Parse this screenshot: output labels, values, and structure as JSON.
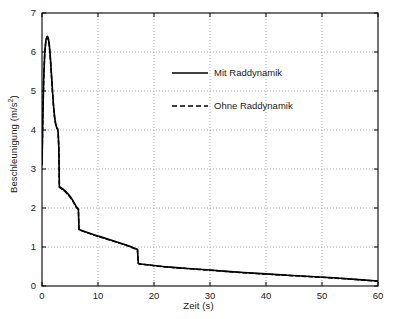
{
  "chart_data": {
    "type": "line",
    "title": "",
    "xlabel": "Zeit (s)",
    "ylabel": "Beschleunigung (m/s²)",
    "xlim": [
      0,
      60
    ],
    "ylim": [
      0,
      7
    ],
    "xticks": [
      0,
      10,
      20,
      30,
      40,
      50,
      60
    ],
    "yticks": [
      0,
      1,
      2,
      3,
      4,
      5,
      6,
      7
    ],
    "xtick_labels": [
      "0",
      "10",
      "20",
      "30",
      "40",
      "50",
      "60"
    ],
    "ytick_labels": [
      "0",
      "1",
      "2",
      "3",
      "4",
      "5",
      "6",
      "7"
    ],
    "grid": true,
    "grid_style": "dotted",
    "legend_position": "upper center",
    "line_color": "#000000",
    "series": [
      {
        "name": "Mit Raddynamik",
        "style": "solid",
        "x": [
          0.0,
          0.15,
          0.3,
          0.5,
          0.7,
          0.85,
          1.0,
          1.15,
          1.3,
          1.5,
          1.7,
          1.9,
          2.1,
          2.3,
          2.5,
          2.65,
          2.8,
          2.9,
          3.0,
          3.05,
          3.1,
          3.4,
          3.8,
          4.2,
          4.6,
          5.0,
          5.4,
          5.8,
          6.1,
          6.35,
          6.5,
          6.55,
          6.6,
          7.0,
          7.6,
          8.4,
          9.4,
          10.5,
          11.6,
          12.7,
          13.8,
          14.9,
          15.8,
          16.5,
          16.9,
          17.05,
          17.1,
          17.2,
          17.6,
          18.5,
          20.0,
          22.0,
          24.0,
          26.0,
          28.0,
          30.0,
          33.0,
          36.0,
          40.0,
          44.0,
          48.0,
          52.0,
          56.0,
          60.0
        ],
        "y": [
          3.1,
          4.3,
          5.3,
          6.0,
          6.3,
          6.38,
          6.4,
          6.34,
          6.2,
          5.85,
          5.4,
          4.95,
          4.55,
          4.28,
          4.12,
          4.06,
          4.03,
          3.9,
          3.55,
          3.1,
          2.55,
          2.52,
          2.48,
          2.43,
          2.37,
          2.3,
          2.22,
          2.12,
          2.04,
          2.0,
          1.98,
          1.72,
          1.45,
          1.43,
          1.4,
          1.36,
          1.31,
          1.26,
          1.21,
          1.16,
          1.11,
          1.06,
          1.01,
          0.97,
          0.95,
          0.94,
          0.8,
          0.58,
          0.565,
          0.55,
          0.525,
          0.495,
          0.47,
          0.45,
          0.43,
          0.41,
          0.375,
          0.345,
          0.31,
          0.275,
          0.245,
          0.21,
          0.17,
          0.13
        ]
      },
      {
        "name": "Ohne Raddynamik",
        "style": "dashed",
        "x": [
          0.0,
          0.15,
          0.3,
          0.5,
          0.7,
          0.85,
          1.0,
          1.15,
          1.3,
          1.5,
          1.7,
          1.9,
          2.1,
          2.3,
          2.5,
          2.65,
          2.8,
          2.9,
          3.0,
          3.05,
          3.1,
          3.4,
          3.8,
          4.2,
          4.6,
          5.0,
          5.4,
          5.8,
          6.1,
          6.35,
          6.5,
          6.55,
          6.6,
          7.0,
          7.6,
          8.4,
          9.4,
          10.5,
          11.6,
          12.7,
          13.8,
          14.9,
          15.8,
          16.5,
          16.9,
          17.05,
          17.1,
          17.2,
          17.6,
          18.5,
          20.0,
          22.0,
          24.0,
          26.0,
          28.0,
          30.0,
          33.0,
          36.0,
          40.0,
          44.0,
          48.0,
          52.0,
          56.0,
          60.0
        ],
        "y": [
          3.12,
          4.32,
          5.32,
          6.02,
          6.3,
          6.36,
          6.36,
          6.3,
          6.16,
          5.81,
          5.36,
          4.92,
          4.52,
          4.26,
          4.1,
          4.04,
          4.01,
          3.88,
          3.53,
          3.08,
          2.53,
          2.5,
          2.46,
          2.41,
          2.35,
          2.28,
          2.2,
          2.1,
          2.02,
          1.98,
          1.96,
          1.7,
          1.44,
          1.42,
          1.39,
          1.35,
          1.3,
          1.25,
          1.2,
          1.15,
          1.1,
          1.05,
          1.0,
          0.96,
          0.94,
          0.93,
          0.79,
          0.575,
          0.56,
          0.545,
          0.52,
          0.49,
          0.465,
          0.445,
          0.425,
          0.405,
          0.37,
          0.34,
          0.305,
          0.27,
          0.24,
          0.205,
          0.165,
          0.125
        ]
      }
    ]
  },
  "legend": {
    "entries": [
      {
        "label": "Mit Raddynamik"
      },
      {
        "label": "Ohne Raddynamik"
      }
    ]
  }
}
